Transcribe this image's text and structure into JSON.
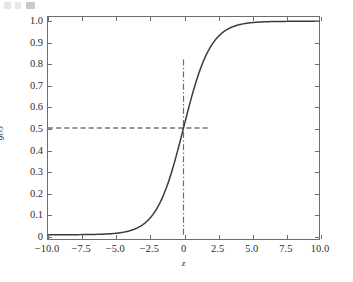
{
  "figure": {
    "background_color": "#ffffff",
    "frame_color": "#6e6e72",
    "tick_label_color": "#2b2b2e"
  },
  "chart_data": {
    "type": "line",
    "title": "",
    "subtitle": "",
    "xlabel": "z",
    "ylabel": "g(z)",
    "xlim": [
      -10.0,
      10.0
    ],
    "ylim": [
      -0.02,
      1.02
    ],
    "grid": false,
    "legend": null,
    "legend_position": "none",
    "xticks": [
      -10.0,
      -7.5,
      -5.0,
      -2.5,
      0,
      2.5,
      5.0,
      7.5,
      10.0
    ],
    "xticklabels": [
      "−10.0",
      "−7.5",
      "−5.0",
      "−2.5",
      "0",
      "2.5",
      "5.0",
      "7.5",
      "10.0"
    ],
    "yticks": [
      0,
      0.1,
      0.2,
      0.3,
      0.4,
      0.5,
      0.6,
      0.7,
      0.8,
      0.9,
      1.0
    ],
    "yticklabels": [
      "0",
      "0.1",
      "0.2",
      "0.3",
      "0.4",
      "0.5",
      "0.6",
      "0.7",
      "0.8",
      "0.9",
      "1.0"
    ],
    "series": [
      {
        "name": "g(z) = 1 / (1 + e^(−z))",
        "style": "solid",
        "color": "#3a3a3e",
        "linewidth": 1.5,
        "x": [
          -10.0,
          -9.5,
          -9.0,
          -8.5,
          -8.0,
          -7.5,
          -7.0,
          -6.5,
          -6.0,
          -5.5,
          -5.0,
          -4.5,
          -4.0,
          -3.5,
          -3.0,
          -2.5,
          -2.0,
          -1.5,
          -1.0,
          -0.5,
          0.0,
          0.5,
          1.0,
          1.5,
          2.0,
          2.5,
          3.0,
          3.5,
          4.0,
          4.5,
          5.0,
          5.5,
          6.0,
          6.5,
          7.0,
          7.5,
          8.0,
          8.5,
          9.0,
          9.5,
          10.0
        ],
        "y": [
          0.0,
          0.0001,
          0.0001,
          0.0002,
          0.0003,
          0.0006,
          0.0009,
          0.0015,
          0.0025,
          0.0041,
          0.0067,
          0.011,
          0.018,
          0.0293,
          0.0474,
          0.0759,
          0.1192,
          0.1824,
          0.2689,
          0.3775,
          0.5,
          0.6225,
          0.7311,
          0.8176,
          0.8808,
          0.9241,
          0.9526,
          0.9707,
          0.982,
          0.989,
          0.9933,
          0.9959,
          0.9975,
          0.9985,
          0.9991,
          0.9994,
          0.9997,
          0.9998,
          0.9999,
          0.9999,
          1.0
        ]
      }
    ],
    "annotations": [
      {
        "name": "half-probability-line",
        "kind": "hline",
        "y": 0.5,
        "x_start": -10.0,
        "x_end": 2.0,
        "style": "dashed",
        "color": "#2b2b2e",
        "linewidth": 1.2
      },
      {
        "name": "decision-boundary-line",
        "kind": "vline",
        "x": 0.0,
        "y_start": 0.0,
        "y_end": 0.83,
        "style": "dashdot",
        "color": "#6a6a6f",
        "linewidth": 1.2
      }
    ]
  }
}
